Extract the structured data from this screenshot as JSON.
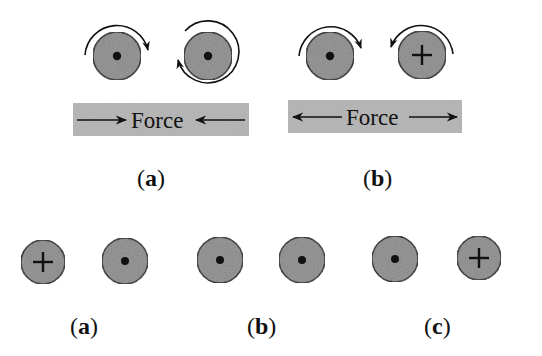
{
  "colors": {
    "circle_fill": "#8a8a8a",
    "circle_stroke": "#111111",
    "bar_fill": "#b3b3b3",
    "ink": "#111111",
    "background": "#ffffff"
  },
  "top_row": {
    "panel_a": {
      "label_open": "(",
      "label_letter": "a",
      "label_close": ")",
      "force_label": "Force",
      "force_direction": "inward (arrows pointing toward each other)",
      "wires": [
        {
          "symbol": "dot",
          "meaning": "current out of page",
          "rotation_arrow": "clockwise, upper arc"
        },
        {
          "symbol": "dot",
          "meaning": "current out of page",
          "rotation_arrow": "counterclockwise, full loop"
        }
      ]
    },
    "panel_b": {
      "label_open": "(",
      "label_letter": "b",
      "label_close": ")",
      "force_label": "Force",
      "force_direction": "outward (arrows pointing away from each other)",
      "wires": [
        {
          "symbol": "dot",
          "meaning": "current out of page",
          "rotation_arrow": "clockwise, upper arc"
        },
        {
          "symbol": "plus",
          "meaning": "current into page",
          "rotation_arrow": "counterclockwise, upper arc"
        }
      ]
    }
  },
  "bottom_row": {
    "panels": [
      {
        "label_open": "(",
        "label_letter": "a",
        "label_close": ")",
        "wires": [
          "plus",
          "dot"
        ]
      },
      {
        "label_open": "(",
        "label_letter": "b",
        "label_close": ")",
        "wires": [
          "dot",
          "dot"
        ]
      },
      {
        "label_open": "(",
        "label_letter": "c",
        "label_close": ")",
        "wires": [
          "dot",
          "plus"
        ]
      }
    ]
  }
}
